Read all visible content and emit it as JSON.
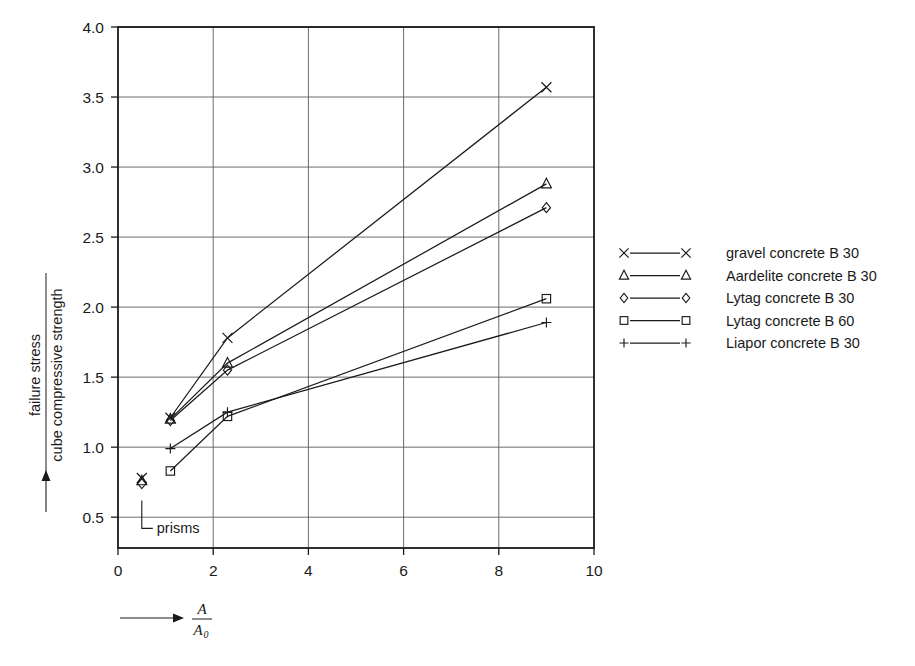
{
  "chart_data": {
    "type": "line",
    "title": "",
    "xlabel": "A / A_0",
    "xlabel_numerator": "A",
    "xlabel_denominator": "A",
    "xlabel_denominator_sub": "0",
    "ylabel": "failure stress / cube compressive strength",
    "ylabel_numerator": "failure stress",
    "ylabel_denominator": "cube compressive strength",
    "xlim": [
      0,
      10
    ],
    "ylim": [
      0.28,
      4.0
    ],
    "xticks": [
      0,
      2,
      4,
      6,
      8,
      10
    ],
    "xtick_labels": [
      "0",
      "2",
      "4",
      "6",
      "8",
      "10"
    ],
    "yticks": [
      0.5,
      1.0,
      1.5,
      2.0,
      2.5,
      3.0,
      3.5,
      4.0
    ],
    "ytick_labels": [
      "0.5",
      "1.0",
      "1.5",
      "2.0",
      "2.5",
      "3.0",
      "3.5",
      "4.0"
    ],
    "grid": true,
    "legend_position": "right",
    "annotations": [
      {
        "text": "prisms",
        "x": 0.5,
        "y": 0.42
      }
    ],
    "series": [
      {
        "name": "gravel concrete B 30",
        "marker": "x-marker",
        "prism_point": {
          "x": 0.5,
          "y": 0.78
        },
        "x": [
          1.1,
          2.3,
          9.0
        ],
        "values": [
          1.21,
          1.78,
          3.57
        ]
      },
      {
        "name": "Aardelite concrete B 30",
        "marker": "triangle-marker",
        "prism_point": {
          "x": 0.5,
          "y": 0.76
        },
        "x": [
          1.1,
          2.3,
          9.0
        ],
        "values": [
          1.2,
          1.6,
          2.88
        ]
      },
      {
        "name": "Lytag concrete B 30",
        "marker": "diamond-marker",
        "prism_point": {
          "x": 0.5,
          "y": 0.74
        },
        "x": [
          1.1,
          2.3,
          9.0
        ],
        "values": [
          1.19,
          1.55,
          2.71
        ]
      },
      {
        "name": "Lytag concrete B 60",
        "marker": "square-marker",
        "prism_point": null,
        "x": [
          1.1,
          2.3,
          9.0
        ],
        "values": [
          0.83,
          1.22,
          2.06
        ]
      },
      {
        "name": "Liapor concrete B 30",
        "marker": "plus-marker",
        "prism_point": null,
        "x": [
          1.1,
          2.3,
          9.0
        ],
        "values": [
          0.99,
          1.25,
          1.89
        ]
      }
    ],
    "colors": {
      "line": "#1a1a1a",
      "grid": "#5a5a5a",
      "frame": "#1a1a1a",
      "background": "#ffffff"
    }
  },
  "legend": {
    "items": [
      {
        "label": "gravel concrete B 30",
        "marker": "x-marker"
      },
      {
        "label": "Aardelite concrete B 30",
        "marker": "triangle-marker"
      },
      {
        "label": "Lytag concrete B 30",
        "marker": "diamond-marker"
      },
      {
        "label": "Lytag concrete B 60",
        "marker": "square-marker"
      },
      {
        "label": "Liapor concrete B 30",
        "marker": "plus-marker"
      }
    ]
  }
}
